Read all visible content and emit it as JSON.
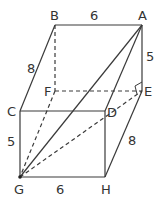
{
  "diagram": {
    "type": "rectangular-prism",
    "stroke_color": "#3a3a3a",
    "vertices": {
      "A": {
        "label": "A",
        "x": 142,
        "y": 25
      },
      "B": {
        "label": "B",
        "x": 55,
        "y": 25
      },
      "C": {
        "label": "C",
        "x": 20,
        "y": 111
      },
      "D": {
        "label": "D",
        "x": 105,
        "y": 111
      },
      "E": {
        "label": "E",
        "x": 142,
        "y": 91
      },
      "F": {
        "label": "F",
        "x": 55,
        "y": 91
      },
      "G": {
        "label": "G",
        "x": 20,
        "y": 177
      },
      "H": {
        "label": "H",
        "x": 105,
        "y": 177
      }
    },
    "dimensions": {
      "BA": "6",
      "AE": "5",
      "BC": "8",
      "CG": "5",
      "GH": "6",
      "HE": "8"
    },
    "solid_edges": [
      "BA",
      "AE",
      "BC",
      "CD",
      "DA",
      "CG",
      "GH",
      "HD",
      "HE",
      "GA"
    ],
    "dashed_edges": [
      "BF",
      "FE",
      "FG",
      "GE"
    ],
    "right_angle_at": "E"
  }
}
